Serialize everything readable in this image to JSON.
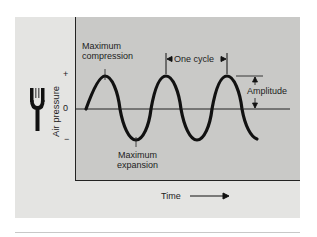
{
  "figure": {
    "y_axis_label": "Air pressure",
    "y_ticks": {
      "plus": "+",
      "zero": "0",
      "minus": "−"
    },
    "x_axis_label": "Time",
    "annotations": {
      "max_compression_line1": "Maximum",
      "max_compression_line2": "compression",
      "max_expansion_line1": "Maximum",
      "max_expansion_line2": "expansion",
      "one_cycle": "One cycle",
      "amplitude": "Amplitude"
    },
    "icon": "tuning-fork-icon",
    "colors": {
      "plot_bg": "#c9c9c7",
      "panel_bg": "#e4e4e2",
      "wave": "#111111"
    }
  }
}
